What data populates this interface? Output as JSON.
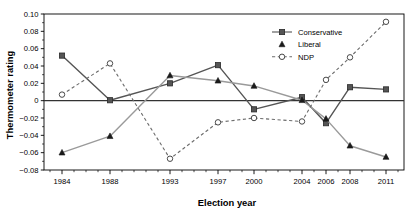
{
  "chart_data": {
    "type": "line",
    "title": "",
    "xlabel": "Election year",
    "ylabel": "Thermometer rating",
    "x": [
      1984,
      1988,
      1993,
      1997,
      2000,
      2004,
      2006,
      2008,
      2011
    ],
    "categories": [
      "1984",
      "1988",
      "1993",
      "1997",
      "2000",
      "2004",
      "2006",
      "2008",
      "2011"
    ],
    "xlim": [
      1982.5,
      2012.5
    ],
    "ylim": [
      -0.08,
      0.1
    ],
    "yticks": [
      0.1,
      0.08,
      0.06,
      0.04,
      0.02,
      0,
      -0.02,
      -0.04,
      -0.06,
      -0.08
    ],
    "ytick_labels": [
      "0.10",
      "0.08",
      "0.06",
      "0.04",
      "0.02",
      "0",
      "-0.02",
      "-0.04",
      "-0.06",
      "-0.08"
    ],
    "grid": false,
    "zero_line": true,
    "legend_position": "top-right",
    "series": [
      {
        "name": "Conservative",
        "marker": "square-filled",
        "linestyle": "solid",
        "color": "#555555",
        "values": [
          0.052,
          0.0005,
          0.02,
          0.041,
          -0.01,
          0.004,
          -0.026,
          0.0155,
          0.013
        ]
      },
      {
        "name": "Liberal",
        "marker": "triangle-filled",
        "linestyle": "solid",
        "color": "#9a9a9a",
        "values": [
          -0.06,
          -0.041,
          0.029,
          0.023,
          0.017,
          0.0005,
          -0.021,
          -0.052,
          -0.065
        ]
      },
      {
        "name": "NDP",
        "marker": "circle-open",
        "linestyle": "dashed",
        "color": "#6b6b6b",
        "values": [
          0.007,
          0.043,
          -0.067,
          -0.025,
          -0.02,
          -0.024,
          0.024,
          0.05,
          0.091
        ]
      }
    ]
  },
  "legend": {
    "entries": [
      {
        "label": "Conservative"
      },
      {
        "label": "Liberal"
      },
      {
        "label": "NDP"
      }
    ]
  }
}
